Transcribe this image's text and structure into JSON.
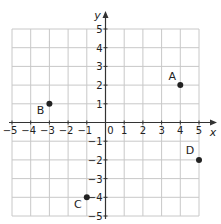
{
  "chart_data": {
    "type": "scatter",
    "title": "",
    "xlabel": "x",
    "ylabel": "y",
    "xlim": [
      -5,
      5
    ],
    "ylim": [
      -5,
      5
    ],
    "grid": true,
    "x_ticks": [
      "-5",
      "-4",
      "-3",
      "-2",
      "-1",
      "1",
      "2",
      "3",
      "4",
      "5"
    ],
    "y_ticks": [
      "5",
      "4",
      "3",
      "2",
      "1",
      "-1",
      "-2",
      "-3",
      "-4",
      "-5"
    ],
    "origin_label": "0",
    "points": [
      {
        "label": "A",
        "x": 4,
        "y": 2
      },
      {
        "label": "B",
        "x": -3,
        "y": 1
      },
      {
        "label": "C",
        "x": -1,
        "y": -4
      },
      {
        "label": "D",
        "x": 5,
        "y": -2
      }
    ]
  },
  "colors": {
    "grid": "#c8c8c8",
    "axis": "#333333",
    "point": "#222222"
  }
}
